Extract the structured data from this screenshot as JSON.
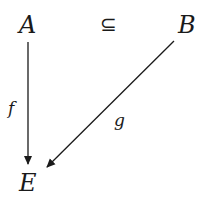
{
  "diagram": {
    "nodes": [
      {
        "id": "A",
        "label": "A"
      },
      {
        "id": "B",
        "label": "B"
      },
      {
        "id": "E",
        "label": "E"
      }
    ],
    "relation": {
      "between": [
        "A",
        "B"
      ],
      "symbol": "⊆"
    },
    "edges": [
      {
        "from": "A",
        "to": "E",
        "label": "f"
      },
      {
        "from": "B",
        "to": "E",
        "label": "g"
      }
    ],
    "colors": {
      "ink": "#1a1a1a",
      "background": "#ffffff"
    }
  }
}
